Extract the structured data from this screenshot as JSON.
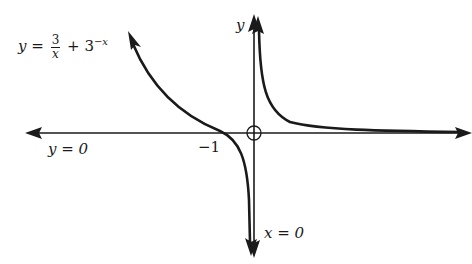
{
  "figure": {
    "type": "function graph",
    "equation": {
      "lhs": "y",
      "equals": "=",
      "frac_num": "3",
      "frac_den": "x",
      "plus": "+ 3",
      "exponent": "−x"
    },
    "axis_labels": {
      "y_axis": "y",
      "vertical_asymptote": "x = 0",
      "horizontal_asymptote": "y = 0"
    },
    "tick_labels": {
      "x_intercept": "−1"
    },
    "origin_marker": "open-circle",
    "colors": {
      "curve": "#1a1a1a",
      "axes": "#1a1a1a",
      "background": "#ffffff"
    }
  }
}
